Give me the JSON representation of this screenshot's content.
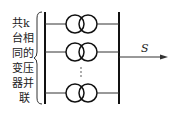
{
  "diagram": {
    "label_lines": [
      "共k",
      "台相",
      "同的",
      "变压",
      "器并",
      "联"
    ],
    "output_label": "S",
    "transformer_rows": 3,
    "ellipsis": "⋮"
  }
}
